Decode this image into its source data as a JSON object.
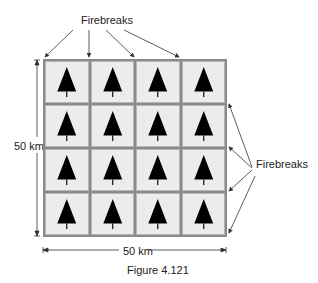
{
  "figure": {
    "caption": "Figure 4.121",
    "top_label": "Firebreaks",
    "right_label": "Firebreaks",
    "left_dimension": "50 km",
    "bottom_dimension": "50 km",
    "grid": {
      "rows": 4,
      "cols": 4,
      "cell_icon": "tree-icon"
    },
    "colors": {
      "cell_fill": "#ececec",
      "firebreak": "#8a8a8a",
      "tree": "#000000",
      "arrow": "#333333"
    }
  }
}
